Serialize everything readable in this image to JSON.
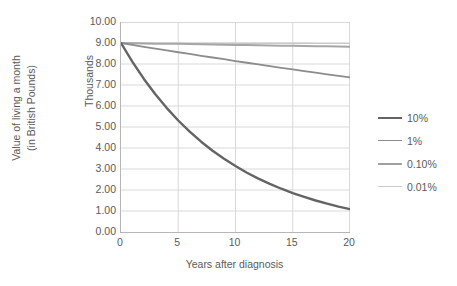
{
  "chart_data": {
    "type": "line",
    "title": "",
    "xlabel": "Years after diagnosis",
    "ylabel": "Value of living a month\n(in British Pounds)",
    "ylabel_line1": "Value of living a month",
    "ylabel_line2": "(in British Pounds)",
    "y_units_label": "Thousands",
    "xlim": [
      0,
      20
    ],
    "ylim": [
      0,
      10
    ],
    "grid": true,
    "legend_position": "right",
    "x_ticks": [
      "0",
      "5",
      "10",
      "15",
      "20"
    ],
    "x_tick_values": [
      0,
      5,
      10,
      15,
      20
    ],
    "y_ticks": [
      "0.00",
      "1.00",
      "2.00",
      "3.00",
      "4.00",
      "5.00",
      "6.00",
      "7.00",
      "8.00",
      "9.00",
      "10.00"
    ],
    "y_tick_values": [
      0,
      1,
      2,
      3,
      4,
      5,
      6,
      7,
      8,
      9,
      10
    ],
    "x": [
      0,
      1,
      2,
      3,
      4,
      5,
      6,
      7,
      8,
      9,
      10,
      11,
      12,
      13,
      14,
      15,
      16,
      17,
      18,
      19,
      20
    ],
    "series": [
      {
        "name": "10%",
        "color": "#646464",
        "values": [
          9.0,
          8.1,
          7.29,
          6.56,
          5.9,
          5.31,
          4.78,
          4.3,
          3.87,
          3.49,
          3.14,
          2.82,
          2.54,
          2.29,
          2.06,
          1.85,
          1.67,
          1.5,
          1.35,
          1.21,
          1.09
        ]
      },
      {
        "name": "1%",
        "color": "#8c8c8c",
        "values": [
          9.0,
          8.91,
          8.82,
          8.73,
          8.65,
          8.56,
          8.48,
          8.39,
          8.31,
          8.23,
          8.14,
          8.06,
          7.98,
          7.9,
          7.82,
          7.74,
          7.66,
          7.59,
          7.51,
          7.43,
          7.36
        ]
      },
      {
        "name": "0.10%",
        "color": "#a6a6a6",
        "values": [
          9.0,
          8.99,
          8.98,
          8.97,
          8.96,
          8.96,
          8.95,
          8.94,
          8.93,
          8.92,
          8.91,
          8.9,
          8.89,
          8.88,
          8.87,
          8.87,
          8.86,
          8.85,
          8.84,
          8.83,
          8.82
        ]
      },
      {
        "name": "0.01%",
        "color": "#c9c9c9",
        "values": [
          9.0,
          9.0,
          9.0,
          8.99,
          8.99,
          8.99,
          8.99,
          8.99,
          8.99,
          8.99,
          8.99,
          8.99,
          8.99,
          8.99,
          8.99,
          8.99,
          8.99,
          8.98,
          8.98,
          8.98,
          8.98
        ]
      }
    ]
  },
  "legend": {
    "items": [
      {
        "label": "10%",
        "color": "#646464",
        "width": 2.4
      },
      {
        "label": "1%",
        "color": "#8c8c8c",
        "width": 1.8
      },
      {
        "label": "0.10%",
        "color": "#a0a0a0",
        "width": 2.0
      },
      {
        "label": "0.01%",
        "color": "#cccccc",
        "width": 1.4
      }
    ]
  },
  "colors": {
    "grid": "#d9d9d9",
    "axis": "#b6b6b6",
    "text": "#5a5a5a",
    "background": "#ffffff"
  }
}
